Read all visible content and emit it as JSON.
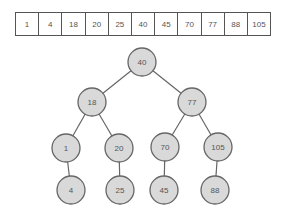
{
  "array": {
    "label": "sorted-array",
    "values": [
      "1",
      "4",
      "18",
      "20",
      "25",
      "40",
      "45",
      "70",
      "77",
      "88",
      "105"
    ]
  },
  "tree": {
    "nodes": [
      {
        "id": "n40",
        "label": "40",
        "x": 142,
        "y": 62
      },
      {
        "id": "n18",
        "label": "18",
        "x": 92,
        "y": 102
      },
      {
        "id": "n77",
        "label": "77",
        "x": 192,
        "y": 102
      },
      {
        "id": "n1",
        "label": "1",
        "x": 66,
        "y": 148
      },
      {
        "id": "n20",
        "label": "20",
        "x": 119,
        "y": 148
      },
      {
        "id": "n70",
        "label": "70",
        "x": 165,
        "y": 147
      },
      {
        "id": "n105",
        "label": "105",
        "x": 218,
        "y": 147
      },
      {
        "id": "n4",
        "label": "4",
        "x": 71,
        "y": 190
      },
      {
        "id": "n25",
        "label": "25",
        "x": 120,
        "y": 190
      },
      {
        "id": "n45",
        "label": "45",
        "x": 164,
        "y": 190
      },
      {
        "id": "n88",
        "label": "88",
        "x": 215,
        "y": 190
      }
    ],
    "edges": [
      [
        "n40",
        "n18"
      ],
      [
        "n40",
        "n77"
      ],
      [
        "n18",
        "n1"
      ],
      [
        "n18",
        "n20"
      ],
      [
        "n77",
        "n70"
      ],
      [
        "n77",
        "n105"
      ],
      [
        "n1",
        "n4"
      ],
      [
        "n20",
        "n25"
      ],
      [
        "n70",
        "n45"
      ],
      [
        "n105",
        "n88"
      ]
    ],
    "node_radius": 14
  },
  "colors": {
    "node_fill": "#d9d9d9",
    "node_stroke": "#666666",
    "text": "#555555",
    "border": "#555555"
  }
}
